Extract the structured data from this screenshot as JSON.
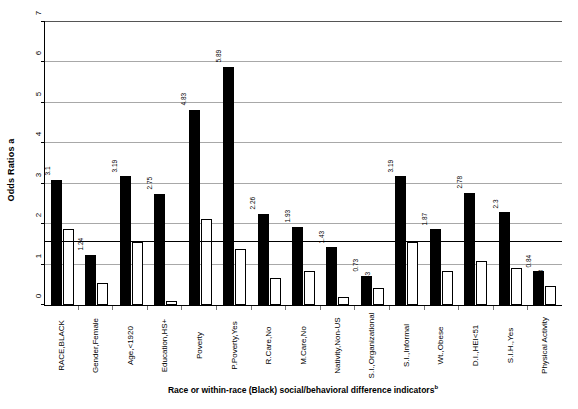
{
  "chart_data": {
    "type": "bar",
    "title": "",
    "subtitle": "",
    "ylabel": "Odds Ratios a",
    "ylabel_text": "Odds Ratios",
    "ylabel_superscript": "a",
    "xlabel": "Race or within-race (Black) social/behavioral difference indicators",
    "xlabel_superscript": "b",
    "ylim": [
      0,
      7
    ],
    "yticks": [
      0,
      1,
      2,
      3,
      4,
      5,
      6,
      7
    ],
    "ytick_labels": [
      "0",
      "1",
      "2",
      "3",
      "4",
      "5",
      "6",
      "7"
    ],
    "grid": true,
    "grid_axis": "y",
    "legend": "none",
    "reference_line": 1.55,
    "categories": [
      "RACE,BLACK",
      "Gender,Female",
      "Age,<1920",
      "Education,HS+",
      "Poverty",
      "P.Poverty,Yes",
      "R.Care,No",
      "M.Care,No",
      "Nativity,Non-US",
      "S.I.,Organizational",
      "S.I.,Informal",
      "Wt.,Obese",
      "D.I.,HEI<51",
      "S.I.H.,Yes",
      "Physical Activity"
    ],
    "series": [
      {
        "name": "Unadjusted",
        "style": "solid-black",
        "color": "#000000",
        "values": [
          3.1,
          1.24,
          3.19,
          2.75,
          4.83,
          5.89,
          2.26,
          1.93,
          1.43,
          0.73,
          3.19,
          1.87,
          2.78,
          2.3,
          0.84
        ],
        "labels": [
          "3.1",
          "1.24",
          "3.19",
          "2.75",
          "4.83",
          "5.89",
          "2.26",
          "1.93",
          "1.43",
          "0.73",
          "3.19",
          "1.87",
          "2.78",
          "2.3",
          "0.84"
        ]
      },
      {
        "name": "Adjusted",
        "style": "hollow-white",
        "color": "#ffffff",
        "values": [
          1.88,
          0.54,
          1.55,
          0.09,
          2.12,
          1.39,
          0.66,
          0.83,
          0.19,
          0.43,
          1.55,
          0.83,
          1.08,
          0.91,
          0.48
        ],
        "labels": [
          "1.88",
          "0.54",
          "1.55",
          "0.09",
          "2.12",
          "1.39",
          "0.66",
          "0.83",
          "0.19",
          "0.43",
          "1.55",
          "0.83",
          "1.08",
          "0.91",
          "0.48"
        ]
      }
    ]
  }
}
